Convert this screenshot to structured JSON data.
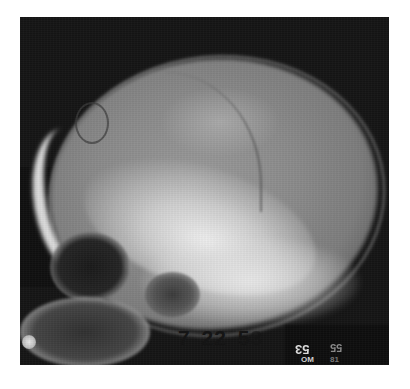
{
  "image": {
    "subject": "Lateral skull X-ray radiograph",
    "background_color": "#ffffff",
    "film_color": "#141414"
  },
  "annotations": {
    "date_label": "7 22 5",
    "date_label_partial_digit": "3",
    "mirrored_label": "53",
    "faded_label": "55",
    "small_label_left": "OM",
    "small_label_right": "81"
  }
}
